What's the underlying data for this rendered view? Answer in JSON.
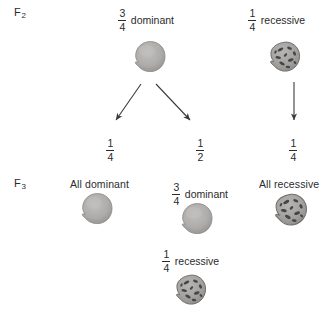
{
  "diagram": {
    "generations": [
      {
        "id": "f2",
        "label": "F",
        "subscript": "2"
      },
      {
        "id": "f3",
        "label": "F",
        "subscript": "3"
      }
    ],
    "colors": {
      "seed_dominant_fill": "#a9a9a7",
      "seed_dominant_stroke": "#8d8d8b",
      "seed_recessive_fill": "#a3a2a0",
      "seed_recessive_stroke": "#6f6e6c",
      "seed_recessive_speckle": "#474645",
      "arrow": "#3b3b3b",
      "text": "#2b2b2b",
      "background": "#ffffff"
    },
    "f2_row": {
      "dominant": {
        "numerator": "3",
        "denominator": "4",
        "word": "dominant",
        "seed_type": "round-smooth-seed"
      },
      "recessive": {
        "numerator": "1",
        "denominator": "4",
        "word": "recessive",
        "seed_type": "wrinkled-speckled-seed"
      }
    },
    "ratios": [
      {
        "id": "left",
        "numerator": "1",
        "denominator": "4"
      },
      {
        "id": "middle",
        "numerator": "1",
        "denominator": "2"
      },
      {
        "id": "right",
        "numerator": "1",
        "denominator": "4"
      }
    ],
    "f3_row": {
      "all_dominant": {
        "label": "All dominant",
        "seed_type": "round-smooth-seed"
      },
      "segregating": {
        "numerator": "3",
        "denominator": "4",
        "word": "dominant",
        "seed_type": "round-smooth-seed",
        "recessive_numerator": "1",
        "recessive_denominator": "4",
        "recessive_word": "recessive",
        "recessive_seed_type": "wrinkled-speckled-seed"
      },
      "all_recessive": {
        "label": "All recessive",
        "seed_type": "wrinkled-speckled-seed"
      }
    },
    "arrows": [
      {
        "id": "f2-dominant-to-left",
        "direction": "diagonal-down-left"
      },
      {
        "id": "f2-dominant-to-middle",
        "direction": "diagonal-down-right"
      },
      {
        "id": "f2-recessive-to-right",
        "direction": "straight-down"
      }
    ]
  }
}
